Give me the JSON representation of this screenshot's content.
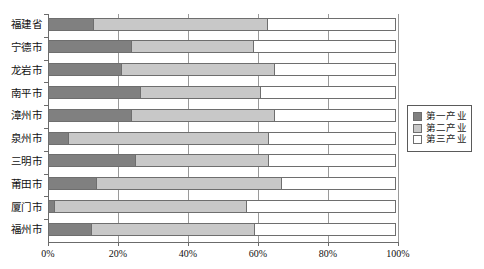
{
  "chart_data": {
    "type": "bar",
    "orientation": "horizontal",
    "stacked": true,
    "title": "",
    "subtitle": "",
    "xlabel": "",
    "ylabel": "",
    "xlim": [
      0,
      100
    ],
    "xticks": [
      0,
      20,
      40,
      60,
      80,
      100
    ],
    "xtick_labels": [
      "0%",
      "20%",
      "40%",
      "60%",
      "80%",
      "100%"
    ],
    "grid": true,
    "legend_position": "right",
    "categories": [
      "福建省",
      "宁德市",
      "龙岩市",
      "南平市",
      "漳州市",
      "泉州市",
      "三明市",
      "莆田市",
      "厦门市",
      "福州市"
    ],
    "series": [
      {
        "name": "第一产业",
        "color": "#808080",
        "values": [
          13,
          24,
          21,
          26.5,
          24,
          6,
          25,
          14,
          2,
          12.5
        ]
      },
      {
        "name": "第二产业",
        "color": "#c8c8c8",
        "values": [
          50,
          35,
          44,
          34.5,
          41,
          57.5,
          38.5,
          53,
          55,
          47
        ]
      },
      {
        "name": "第三产业",
        "color": "#ffffff",
        "values": [
          37,
          41,
          35,
          39,
          35,
          36.5,
          36.5,
          33,
          43,
          40.5
        ]
      }
    ]
  },
  "legend": {
    "items": [
      {
        "label": "第一产业",
        "color": "#808080"
      },
      {
        "label": "第二产业",
        "color": "#c8c8c8"
      },
      {
        "label": "第三产业",
        "color": "#ffffff"
      }
    ]
  }
}
